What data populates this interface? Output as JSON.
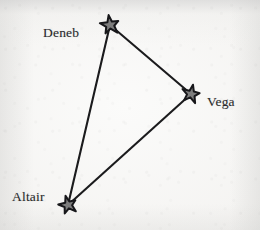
{
  "figure": {
    "name": "summer-triangle-asterism",
    "background_color": "#f7f6f4",
    "line_color": "#1b1b1d",
    "star_fill_color": "#7d7d7d",
    "star_stroke_color": "#17171a",
    "label_color": "#2a2a2c"
  },
  "chart_data": {
    "type": "scatter",
    "title": "",
    "xlabel": "",
    "ylabel": "",
    "grid": false,
    "legend": false,
    "nodes": [
      {
        "id": "deneb",
        "label": "Deneb",
        "x": 110,
        "y": 25,
        "star_size": 15,
        "rotation": -8,
        "label_x": 43,
        "label_y": 26
      },
      {
        "id": "vega",
        "label": "Vega",
        "x": 191,
        "y": 94,
        "star_size": 14,
        "rotation": 12,
        "label_x": 207,
        "label_y": 95
      },
      {
        "id": "altair",
        "label": "Altair",
        "x": 68,
        "y": 205,
        "star_size": 14,
        "rotation": -15,
        "label_x": 12,
        "label_y": 190
      }
    ],
    "edges": [
      {
        "from": "deneb",
        "to": "vega"
      },
      {
        "from": "vega",
        "to": "altair"
      },
      {
        "from": "altair",
        "to": "deneb"
      }
    ]
  }
}
